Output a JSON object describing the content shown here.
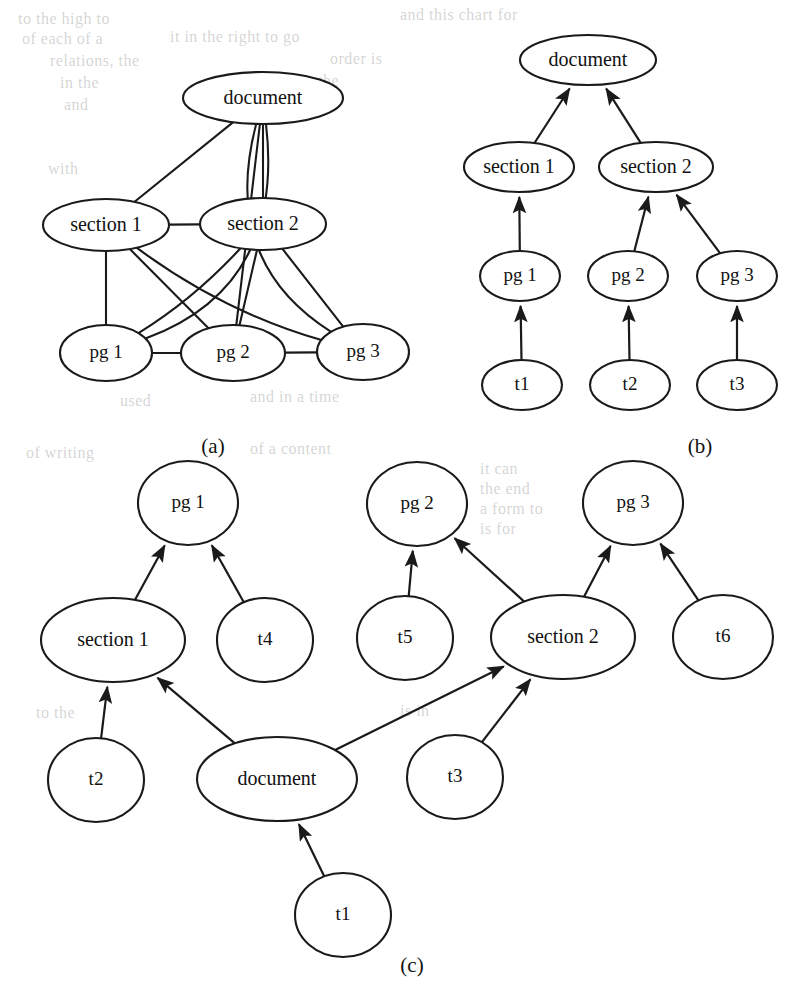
{
  "figure": {
    "background_color": "#ffffff",
    "stroke_color": "#1a1a1a"
  },
  "panels": [
    {
      "id": "a",
      "caption": "(a)",
      "caption_pos": {
        "x": 213,
        "y": 448
      },
      "graph_type": "undirected",
      "nodes": [
        {
          "id": "document",
          "label": "document",
          "x": 263,
          "y": 98,
          "rx": 80,
          "ry": 26
        },
        {
          "id": "section1",
          "label": "section 1",
          "x": 106,
          "y": 225,
          "rx": 63,
          "ry": 26
        },
        {
          "id": "section2",
          "label": "section 2",
          "x": 263,
          "y": 224,
          "rx": 63,
          "ry": 26
        },
        {
          "id": "pg1",
          "label": "pg 1",
          "x": 106,
          "y": 353,
          "rx": 46,
          "ry": 28
        },
        {
          "id": "pg2",
          "label": "pg 2",
          "x": 233,
          "y": 353,
          "rx": 52,
          "ry": 28
        },
        {
          "id": "pg3",
          "label": "pg 3",
          "x": 363,
          "y": 352,
          "rx": 46,
          "ry": 28
        }
      ],
      "edges": [
        {
          "from": "document",
          "to": "section1"
        },
        {
          "from": "document",
          "to": "section2"
        },
        {
          "from": "document",
          "to": "pg1"
        },
        {
          "from": "document",
          "to": "pg2"
        },
        {
          "from": "document",
          "to": "pg3"
        },
        {
          "from": "section1",
          "to": "section2"
        },
        {
          "from": "section1",
          "to": "pg1"
        },
        {
          "from": "section1",
          "to": "pg2"
        },
        {
          "from": "section1",
          "to": "pg3"
        },
        {
          "from": "section2",
          "to": "pg1"
        },
        {
          "from": "section2",
          "to": "pg2"
        },
        {
          "from": "section2",
          "to": "pg3"
        },
        {
          "from": "pg1",
          "to": "pg2"
        },
        {
          "from": "pg2",
          "to": "pg3"
        }
      ]
    },
    {
      "id": "b",
      "caption": "(b)",
      "caption_pos": {
        "x": 700,
        "y": 448
      },
      "graph_type": "directed",
      "nodes": [
        {
          "id": "document",
          "label": "document",
          "x": 588,
          "y": 60,
          "rx": 68,
          "ry": 25
        },
        {
          "id": "section1",
          "label": "section 1",
          "x": 519,
          "y": 167,
          "rx": 55,
          "ry": 25
        },
        {
          "id": "section2",
          "label": "section 2",
          "x": 656,
          "y": 167,
          "rx": 57,
          "ry": 25
        },
        {
          "id": "pg1",
          "label": "pg 1",
          "x": 520,
          "y": 276,
          "rx": 40,
          "ry": 25
        },
        {
          "id": "pg2",
          "label": "pg 2",
          "x": 628,
          "y": 276,
          "rx": 40,
          "ry": 25
        },
        {
          "id": "pg3",
          "label": "pg 3",
          "x": 737,
          "y": 276,
          "rx": 40,
          "ry": 25
        },
        {
          "id": "t1",
          "label": "t1",
          "x": 522,
          "y": 385,
          "rx": 40,
          "ry": 25
        },
        {
          "id": "t2",
          "label": "t2",
          "x": 630,
          "y": 385,
          "rx": 40,
          "ry": 25
        },
        {
          "id": "t3",
          "label": "t3",
          "x": 737,
          "y": 385,
          "rx": 40,
          "ry": 25
        }
      ],
      "edges": [
        {
          "from": "section1",
          "to": "document"
        },
        {
          "from": "section2",
          "to": "document"
        },
        {
          "from": "pg1",
          "to": "section1"
        },
        {
          "from": "pg2",
          "to": "section2"
        },
        {
          "from": "pg3",
          "to": "section2"
        },
        {
          "from": "t1",
          "to": "pg1"
        },
        {
          "from": "t2",
          "to": "pg2"
        },
        {
          "from": "t3",
          "to": "pg3"
        }
      ]
    },
    {
      "id": "c",
      "caption": "(c)",
      "caption_pos": {
        "x": 412,
        "y": 967
      },
      "graph_type": "directed",
      "nodes": [
        {
          "id": "pg1",
          "label": "pg 1",
          "x": 188,
          "y": 503,
          "rx": 50,
          "ry": 42
        },
        {
          "id": "pg2",
          "label": "pg 2",
          "x": 417,
          "y": 504,
          "rx": 50,
          "ry": 42
        },
        {
          "id": "pg3",
          "label": "pg 3",
          "x": 633,
          "y": 503,
          "rx": 50,
          "ry": 42
        },
        {
          "id": "section1",
          "label": "section 1",
          "x": 113,
          "y": 640,
          "rx": 72,
          "ry": 42
        },
        {
          "id": "t4",
          "label": "t4",
          "x": 265,
          "y": 640,
          "rx": 48,
          "ry": 42
        },
        {
          "id": "t5",
          "label": "t5",
          "x": 405,
          "y": 638,
          "rx": 48,
          "ry": 42
        },
        {
          "id": "section2",
          "label": "section 2",
          "x": 563,
          "y": 637,
          "rx": 72,
          "ry": 42
        },
        {
          "id": "t6",
          "label": "t6",
          "x": 723,
          "y": 637,
          "rx": 50,
          "ry": 42
        },
        {
          "id": "t2",
          "label": "t2",
          "x": 96,
          "y": 780,
          "rx": 48,
          "ry": 42
        },
        {
          "id": "document",
          "label": "document",
          "x": 277,
          "y": 779,
          "rx": 80,
          "ry": 42
        },
        {
          "id": "t3",
          "label": "t3",
          "x": 455,
          "y": 777,
          "rx": 48,
          "ry": 42
        },
        {
          "id": "t1",
          "label": "t1",
          "x": 343,
          "y": 915,
          "rx": 48,
          "ry": 42
        }
      ],
      "edges": [
        {
          "from": "section1",
          "to": "pg1"
        },
        {
          "from": "t4",
          "to": "pg1"
        },
        {
          "from": "t5",
          "to": "pg2"
        },
        {
          "from": "section2",
          "to": "pg2"
        },
        {
          "from": "section2",
          "to": "pg3"
        },
        {
          "from": "t6",
          "to": "pg3"
        },
        {
          "from": "t2",
          "to": "section1"
        },
        {
          "from": "document",
          "to": "section1"
        },
        {
          "from": "document",
          "to": "section2"
        },
        {
          "from": "t3",
          "to": "section2"
        },
        {
          "from": "t1",
          "to": "document"
        }
      ]
    }
  ],
  "bleed_text": [
    {
      "text": "to the high to",
      "x": 18,
      "y": 10
    },
    {
      "text": "and this chart for",
      "x": 400,
      "y": 6
    },
    {
      "text": "of each of a",
      "x": 22,
      "y": 30
    },
    {
      "text": "it in the right to go",
      "x": 170,
      "y": 28
    },
    {
      "text": "relations, the",
      "x": 50,
      "y": 52
    },
    {
      "text": "order is",
      "x": 330,
      "y": 50
    },
    {
      "text": "in the",
      "x": 60,
      "y": 74
    },
    {
      "text": "to the",
      "x": 300,
      "y": 72
    },
    {
      "text": "and",
      "x": 64,
      "y": 96
    },
    {
      "text": "the",
      "x": 320,
      "y": 94
    },
    {
      "text": "with",
      "x": 48,
      "y": 160
    },
    {
      "text": "used",
      "x": 120,
      "y": 392
    },
    {
      "text": "and in a time",
      "x": 250,
      "y": 388
    },
    {
      "text": "is",
      "x": 520,
      "y": 386
    },
    {
      "text": "of writing",
      "x": 26,
      "y": 444
    },
    {
      "text": "of a content",
      "x": 250,
      "y": 440
    },
    {
      "text": "it can",
      "x": 480,
      "y": 460
    },
    {
      "text": "the end",
      "x": 480,
      "y": 480
    },
    {
      "text": "a form to",
      "x": 480,
      "y": 500
    },
    {
      "text": "is for",
      "x": 480,
      "y": 520
    },
    {
      "text": "to the",
      "x": 36,
      "y": 704
    },
    {
      "text": "is in",
      "x": 400,
      "y": 702
    }
  ]
}
